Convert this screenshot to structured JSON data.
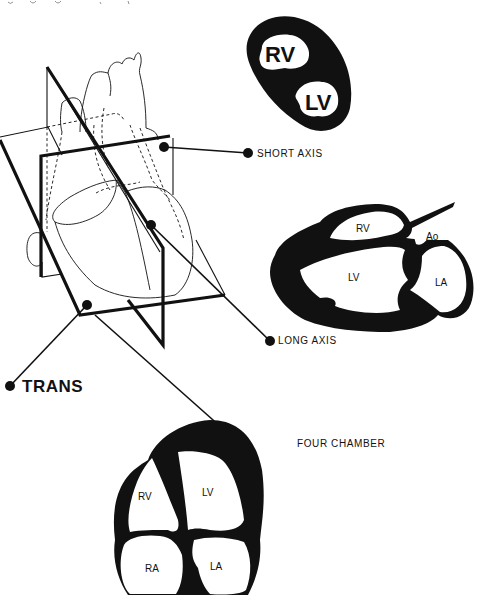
{
  "caption_clipped": "...",
  "planes": {
    "short_axis": {
      "label": "SHORT AXIS"
    },
    "long_axis": {
      "label": "LONG AXIS"
    },
    "trans": {
      "label": "TRANS"
    },
    "four_chamber": {
      "label": "FOUR CHAMBER"
    }
  },
  "short_axis_view": {
    "rv": "RV",
    "lv": "LV"
  },
  "long_axis_view": {
    "rv": "RV",
    "lv": "LV",
    "ao": "Ao",
    "la": "LA"
  },
  "four_chamber_view": {
    "rv": "RV",
    "lv": "LV",
    "ra": "RA",
    "la": "LA"
  },
  "colors": {
    "ink": "#111111",
    "background": "#ffffff"
  }
}
